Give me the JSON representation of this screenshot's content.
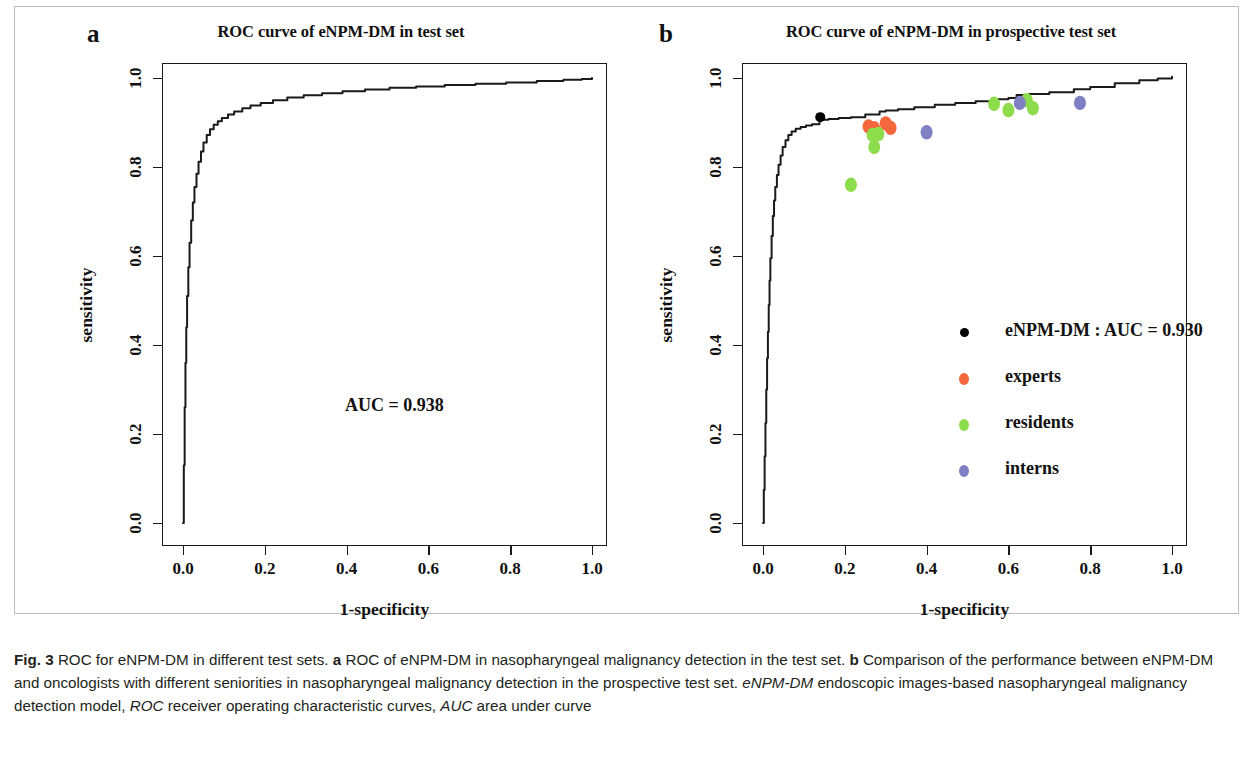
{
  "figure": {
    "label": "Fig. 3",
    "caption_main": " ROC for eNPM-DM in different test sets. ",
    "caption_a_letter": "a",
    "caption_a_text": " ROC of eNPM-DM in nasopharyngeal malignancy detection in the test set. ",
    "caption_b_letter": "b",
    "caption_b_text": " Comparison of the performance between eNPM-DM and oncologists with different seniorities in nasopharyngeal malignancy detection in the prospective test set. ",
    "abbr_1_term": "eNPM-DM",
    "abbr_1_def": " endoscopic images-based nasopharyngeal malignancy detection model, ",
    "abbr_2_term": "ROC",
    "abbr_2_def": " receiver operating characteristic curves, ",
    "abbr_3_term": "AUC",
    "abbr_3_def": " area under curve"
  },
  "panel_a": {
    "letter": "a",
    "title": "ROC curve of eNPM-DM in test set",
    "auc_annotation": "AUC = 0.938"
  },
  "panel_b": {
    "letter": "b",
    "title": "ROC curve of eNPM-DM in prospective test set",
    "legend": [
      {
        "label": "eNPM-DM : AUC = 0.930",
        "color": "#000000",
        "name": "enpm-dm"
      },
      {
        "label": "experts",
        "color": "#f4673c",
        "name": "experts"
      },
      {
        "label": "residents",
        "color": "#8ddc4c",
        "name": "residents"
      },
      {
        "label": "interns",
        "color": "#7f7fc4",
        "name": "interns"
      }
    ]
  },
  "axes": {
    "xlabel": "1-specificity",
    "ylabel": "sensitivity",
    "xticks": [
      "0.0",
      "0.2",
      "0.4",
      "0.6",
      "0.8",
      "1.0"
    ],
    "yticks": [
      "0.0",
      "0.2",
      "0.4",
      "0.6",
      "0.8",
      "1.0"
    ]
  },
  "chart_data": [
    {
      "type": "line",
      "name": "panel_a_roc",
      "title": "ROC curve of eNPM-DM in test set",
      "xlabel": "1-specificity",
      "ylabel": "sensitivity",
      "xlim": [
        0,
        1
      ],
      "ylim": [
        0,
        1
      ],
      "grid": false,
      "legend": "none",
      "annotations": [
        {
          "text": "AUC = 0.938",
          "x": 0.52,
          "y": 0.27
        }
      ],
      "auc": 0.938,
      "series": [
        {
          "name": "eNPM-DM",
          "color": "#1a1a1a",
          "x": [
            0.0,
            0.002,
            0.004,
            0.006,
            0.008,
            0.01,
            0.013,
            0.016,
            0.02,
            0.024,
            0.028,
            0.033,
            0.038,
            0.044,
            0.05,
            0.058,
            0.066,
            0.075,
            0.085,
            0.095,
            0.11,
            0.125,
            0.145,
            0.165,
            0.19,
            0.22,
            0.255,
            0.295,
            0.34,
            0.39,
            0.445,
            0.505,
            0.57,
            0.64,
            0.715,
            0.79,
            0.865,
            0.93,
            0.975,
            1.0
          ],
          "y": [
            0.0,
            0.13,
            0.26,
            0.36,
            0.44,
            0.51,
            0.575,
            0.63,
            0.68,
            0.72,
            0.755,
            0.785,
            0.812,
            0.835,
            0.855,
            0.872,
            0.885,
            0.895,
            0.903,
            0.91,
            0.918,
            0.925,
            0.932,
            0.938,
            0.944,
            0.95,
            0.956,
            0.961,
            0.966,
            0.97,
            0.974,
            0.978,
            0.981,
            0.984,
            0.987,
            0.99,
            0.993,
            0.996,
            0.998,
            1.0
          ]
        }
      ]
    },
    {
      "type": "scatter",
      "name": "panel_b_roc",
      "title": "ROC curve of eNPM-DM in prospective test set",
      "xlabel": "1-specificity",
      "ylabel": "sensitivity",
      "xlim": [
        0,
        1
      ],
      "ylim": [
        0,
        1
      ],
      "grid": false,
      "legend": "inside-left",
      "auc": 0.93,
      "series": [
        {
          "name": "eNPM-DM ROC curve",
          "type": "line",
          "color": "#1a1a1a",
          "x": [
            0.0,
            0.002,
            0.004,
            0.006,
            0.008,
            0.01,
            0.012,
            0.014,
            0.016,
            0.018,
            0.021,
            0.024,
            0.027,
            0.03,
            0.034,
            0.038,
            0.043,
            0.048,
            0.055,
            0.062,
            0.07,
            0.08,
            0.092,
            0.105,
            0.12,
            0.138,
            0.14,
            0.16,
            0.185,
            0.215,
            0.25,
            0.285,
            0.3,
            0.33,
            0.37,
            0.42,
            0.47,
            0.52,
            0.57,
            0.6,
            0.62,
            0.65,
            0.7,
            0.76,
            0.8,
            0.86,
            0.92,
            0.965,
            1.0
          ],
          "y": [
            0.0,
            0.075,
            0.15,
            0.225,
            0.3,
            0.37,
            0.43,
            0.49,
            0.545,
            0.595,
            0.645,
            0.69,
            0.725,
            0.755,
            0.782,
            0.805,
            0.826,
            0.845,
            0.86,
            0.872,
            0.88,
            0.886,
            0.89,
            0.893,
            0.896,
            0.905,
            0.906,
            0.908,
            0.91,
            0.912,
            0.918,
            0.925,
            0.927,
            0.93,
            0.934,
            0.94,
            0.944,
            0.948,
            0.952,
            0.955,
            0.962,
            0.964,
            0.968,
            0.975,
            0.98,
            0.988,
            0.995,
            0.999,
            1.003
          ]
        },
        {
          "name": "eNPM-DM",
          "type": "point",
          "color": "#000000",
          "points": [
            {
              "x": 0.14,
              "y": 0.912
            }
          ]
        },
        {
          "name": "experts",
          "type": "point",
          "color": "#f4673c",
          "points": [
            {
              "x": 0.258,
              "y": 0.891
            },
            {
              "x": 0.272,
              "y": 0.887
            },
            {
              "x": 0.3,
              "y": 0.898
            },
            {
              "x": 0.312,
              "y": 0.888
            }
          ]
        },
        {
          "name": "residents",
          "type": "point",
          "color": "#8ddc4c",
          "points": [
            {
              "x": 0.215,
              "y": 0.76
            },
            {
              "x": 0.268,
              "y": 0.872
            },
            {
              "x": 0.272,
              "y": 0.845
            },
            {
              "x": 0.282,
              "y": 0.874
            },
            {
              "x": 0.565,
              "y": 0.942
            },
            {
              "x": 0.6,
              "y": 0.928
            },
            {
              "x": 0.645,
              "y": 0.95
            },
            {
              "x": 0.66,
              "y": 0.932
            }
          ]
        },
        {
          "name": "interns",
          "type": "point",
          "color": "#7f7fc4",
          "points": [
            {
              "x": 0.4,
              "y": 0.878
            },
            {
              "x": 0.628,
              "y": 0.944
            },
            {
              "x": 0.775,
              "y": 0.944
            }
          ]
        }
      ]
    }
  ]
}
